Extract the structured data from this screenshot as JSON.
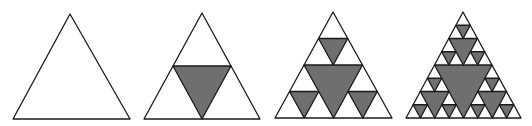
{
  "diagram": {
    "stroke_color": "#1a1a1a",
    "fill_color": "#6f6f6f",
    "background": "#ffffff",
    "stroke_width": 1.3,
    "panels": [
      {
        "label": "iteration-0",
        "depth": 0,
        "apex": [
          70,
          14
        ],
        "left": [
          13,
          119
        ],
        "right": [
          130,
          119
        ]
      },
      {
        "label": "iteration-1",
        "depth": 1,
        "apex": [
          202,
          13
        ],
        "left": [
          144,
          119
        ],
        "right": [
          260,
          119
        ]
      },
      {
        "label": "iteration-2",
        "depth": 2,
        "apex": [
          333,
          12
        ],
        "left": [
          275,
          118
        ],
        "right": [
          392,
          118
        ]
      },
      {
        "label": "iteration-3",
        "depth": 3,
        "apex": [
          463,
          12
        ],
        "left": [
          406,
          118
        ],
        "right": [
          521,
          118
        ]
      }
    ]
  }
}
